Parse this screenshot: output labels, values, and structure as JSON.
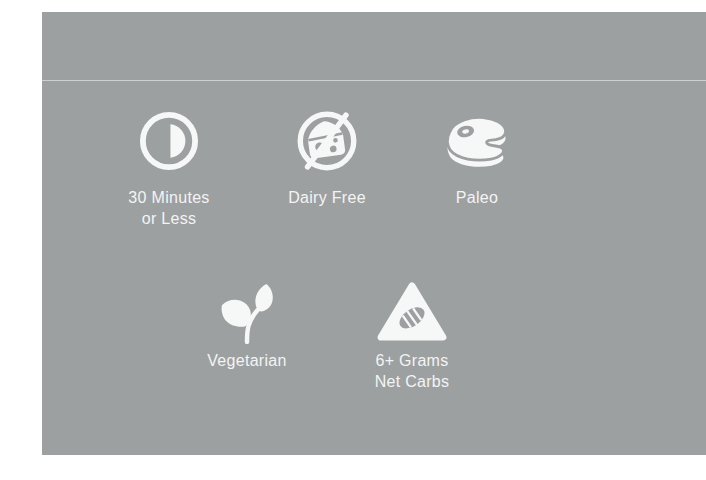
{
  "colors": {
    "page_bg": "#ffffff",
    "card_bg": "#9da0a1",
    "divider": "rgba(255,255,255,0.5)",
    "icon": "#f6f7f7",
    "text": "#f3f4f4"
  },
  "badges": {
    "row1": [
      {
        "icon": "thirty-minutes-icon",
        "label_lines": [
          "30 Minutes",
          "or Less"
        ]
      },
      {
        "icon": "dairy-free-icon",
        "label_lines": [
          "Dairy Free"
        ]
      },
      {
        "icon": "paleo-steak-icon",
        "label_lines": [
          "Paleo"
        ]
      }
    ],
    "row2": [
      {
        "icon": "vegetarian-sprout-icon",
        "label_lines": [
          "Vegetarian"
        ]
      },
      {
        "icon": "net-carbs-bread-icon",
        "label_lines": [
          "6+ Grams",
          "Net Carbs"
        ]
      }
    ]
  }
}
